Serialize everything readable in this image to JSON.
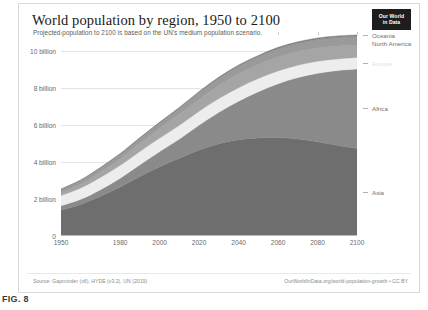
{
  "figure": {
    "caption": "FIG. 8"
  },
  "header": {
    "title": "World population by region, 1950 to 2100",
    "subtitle": "Projected population to 2100 is based on the UN's medium population scenario.",
    "logo_line1": "Our World",
    "logo_line2": "in Data"
  },
  "footer": {
    "source": "Source: Gapminder (v6), HYDE (v3.2), UN (2019)",
    "credit": "OurWorldInData.org/world-population-growth • CC BY"
  },
  "colors": {
    "asia": "#6e6e6e",
    "africa": "#8a8a8a",
    "europe": "#ededed",
    "latin_america": "#a5a5a5",
    "north_america": "#9a9a9a",
    "oceania": "#7d7d7d",
    "gridline": "#e3e3e3",
    "axis_text": "#6a6a6a"
  },
  "chart_data": {
    "type": "area",
    "title": "World population by region, 1950 to 2100",
    "subtitle": "Projected population to 2100 is based on the UN's medium population scenario.",
    "xlabel": "",
    "ylabel": "",
    "stacked": true,
    "grid": true,
    "legend_position": "right",
    "xlim": [
      1950,
      2100
    ],
    "ylim": [
      0,
      11
    ],
    "y_unit": "billion",
    "yticks": [
      0,
      2,
      4,
      6,
      8,
      10
    ],
    "ytick_labels": [
      "0",
      "2 billion",
      "4 billion",
      "6 billion",
      "8 billion",
      "10 billion"
    ],
    "xticks": [
      1950,
      1980,
      2000,
      2020,
      2040,
      2060,
      2080,
      2100
    ],
    "xtick_labels": [
      "1950",
      "1980",
      "2000",
      "2020",
      "2040",
      "2060",
      "2080",
      "2100"
    ],
    "x": [
      1950,
      1960,
      1970,
      1980,
      1990,
      2000,
      2010,
      2020,
      2030,
      2040,
      2050,
      2060,
      2070,
      2080,
      2090,
      2100
    ],
    "series": [
      {
        "name": "Asia",
        "color": "#6e6e6e",
        "values": [
          1.4,
          1.7,
          2.14,
          2.64,
          3.21,
          3.74,
          4.19,
          4.64,
          4.98,
          5.19,
          5.29,
          5.31,
          5.23,
          5.08,
          4.89,
          4.72
        ]
      },
      {
        "name": "Africa",
        "color": "#8a8a8a",
        "values": [
          0.23,
          0.28,
          0.36,
          0.48,
          0.63,
          0.81,
          1.04,
          1.34,
          1.69,
          2.08,
          2.49,
          2.9,
          3.31,
          3.69,
          4.03,
          4.28
        ]
      },
      {
        "name": "Europe",
        "color": "#ededed",
        "values": [
          0.55,
          0.61,
          0.66,
          0.69,
          0.72,
          0.73,
          0.74,
          0.75,
          0.74,
          0.73,
          0.71,
          0.69,
          0.67,
          0.65,
          0.63,
          0.63
        ]
      },
      {
        "name": "Latin America",
        "color": "#a5a5a5",
        "values": [
          0.17,
          0.22,
          0.29,
          0.36,
          0.44,
          0.52,
          0.59,
          0.65,
          0.71,
          0.75,
          0.76,
          0.76,
          0.74,
          0.72,
          0.69,
          0.65
        ]
      },
      {
        "name": "North America",
        "color": "#9a9a9a",
        "values": [
          0.17,
          0.2,
          0.23,
          0.25,
          0.28,
          0.31,
          0.34,
          0.37,
          0.4,
          0.42,
          0.43,
          0.45,
          0.46,
          0.47,
          0.48,
          0.49
        ]
      },
      {
        "name": "Oceania",
        "color": "#7d7d7d",
        "values": [
          0.013,
          0.016,
          0.02,
          0.023,
          0.027,
          0.031,
          0.037,
          0.043,
          0.048,
          0.053,
          0.057,
          0.061,
          0.065,
          0.068,
          0.071,
          0.074
        ]
      }
    ],
    "totals": [
      2.54,
      3.03,
      3.7,
      4.44,
      5.31,
      6.14,
      6.94,
      7.79,
      8.57,
      9.22,
      9.74,
      10.17,
      10.48,
      10.68,
      10.79,
      10.85
    ],
    "legend_labels": [
      "Oceania",
      "North America",
      "Europe",
      "Africa",
      "Asia"
    ]
  }
}
